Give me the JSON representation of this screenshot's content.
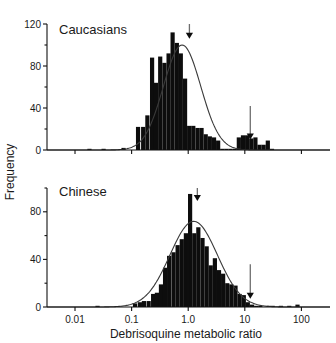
{
  "figure": {
    "xlabel": "Debrisoquine metabolic ratio",
    "ylabel": "Frequency"
  },
  "chart_data": [
    {
      "type": "bar",
      "title": "Caucasians",
      "xlabel": "Debrisoquine metabolic ratio",
      "ylabel": "Frequency",
      "xscale": "log",
      "xlim": [
        0.0032,
        320
      ],
      "ylim": [
        0,
        120
      ],
      "yticks": [
        0,
        40,
        80,
        120
      ],
      "ytick_labels": [
        "0",
        "40",
        "80",
        "120"
      ],
      "yminor_ticks": [
        20,
        60,
        100
      ],
      "xticks": [
        0.01,
        0.1,
        1.0,
        10,
        100
      ],
      "xtick_labels": [
        "0.01",
        "0.1",
        "1.0",
        "10",
        "100"
      ],
      "grid": false,
      "x": [
        0.018,
        0.032,
        0.072,
        0.13,
        0.16,
        0.19,
        0.23,
        0.27,
        0.32,
        0.38,
        0.45,
        0.53,
        0.63,
        0.74,
        0.88,
        1.04,
        1.23,
        1.46,
        1.72,
        2.04,
        2.41,
        2.86,
        3.38,
        4.0,
        4.73,
        5.6,
        6.63,
        7.84,
        9.28,
        11.0,
        13.0,
        15.4,
        18.2,
        21.5,
        25.5,
        30.2,
        35.7,
        42.2,
        50.0,
        59.2,
        70.0,
        82.9,
        98.0,
        140.0
      ],
      "values": [
        1,
        1,
        2,
        22,
        22,
        33,
        88,
        64,
        89,
        83,
        92,
        112,
        102,
        92,
        68,
        23,
        23,
        21,
        21,
        15,
        13,
        12,
        9,
        1,
        1,
        1,
        1,
        12,
        14,
        14,
        11,
        12,
        5,
        5,
        9,
        1,
        0,
        0,
        0,
        0,
        0,
        0,
        0,
        0
      ],
      "fit_curve": {
        "peak": 100,
        "center": 0.78,
        "log_sigma": 0.33
      },
      "annotations": [
        {
          "label": "extensive-metabolizer-arrow",
          "x": 1.05,
          "y_top": 120,
          "y_tip": 106
        },
        {
          "label": "poor-metabolizer-antimode-arrow",
          "x": 12.5,
          "y_top": 42,
          "y_tip": 10
        }
      ]
    },
    {
      "type": "bar",
      "title": "Chinese",
      "xlabel": "Debrisoquine metabolic ratio",
      "ylabel": "Frequency",
      "xscale": "log",
      "xlim": [
        0.0032,
        320
      ],
      "ylim": [
        0,
        100
      ],
      "yticks": [
        0,
        40,
        80
      ],
      "ytick_labels": [
        "0",
        "40",
        "80"
      ],
      "yminor_ticks": [
        20,
        60,
        100
      ],
      "xticks": [
        0.01,
        0.1,
        1.0,
        10,
        100
      ],
      "xtick_labels": [
        "0.01",
        "0.1",
        "1.0",
        "10",
        "100"
      ],
      "grid": false,
      "x": [
        0.025,
        0.115,
        0.14,
        0.165,
        0.2,
        0.24,
        0.28,
        0.33,
        0.39,
        0.46,
        0.55,
        0.65,
        0.77,
        0.91,
        1.08,
        1.28,
        1.51,
        1.79,
        2.12,
        2.5,
        2.96,
        3.5,
        4.14,
        4.9,
        5.8,
        6.85,
        8.1,
        9.6,
        11.3,
        13.4,
        15.9,
        18.8,
        22.2,
        26.3,
        31.1,
        36.8,
        43.5,
        51.5,
        61.0,
        72.1,
        85.3,
        101.0,
        120.0
      ],
      "values": [
        1,
        3,
        4,
        5,
        5,
        11,
        12,
        19,
        33,
        43,
        46,
        52,
        57,
        62,
        95,
        62,
        67,
        58,
        51,
        35,
        41,
        31,
        28,
        20,
        19,
        18,
        11,
        10,
        4,
        2,
        1,
        1,
        0,
        1,
        1,
        0,
        1,
        0,
        1,
        0,
        2,
        0,
        0
      ],
      "fit_curve": {
        "peak": 72,
        "center": 1.25,
        "log_sigma": 0.42
      },
      "annotations": [
        {
          "label": "extensive-metabolizer-arrow",
          "x": 1.45,
          "y_top": 100,
          "y_tip": 89
        },
        {
          "label": "poor-metabolizer-antimode-arrow",
          "x": 12.5,
          "y_top": 36,
          "y_tip": 7
        }
      ]
    }
  ]
}
